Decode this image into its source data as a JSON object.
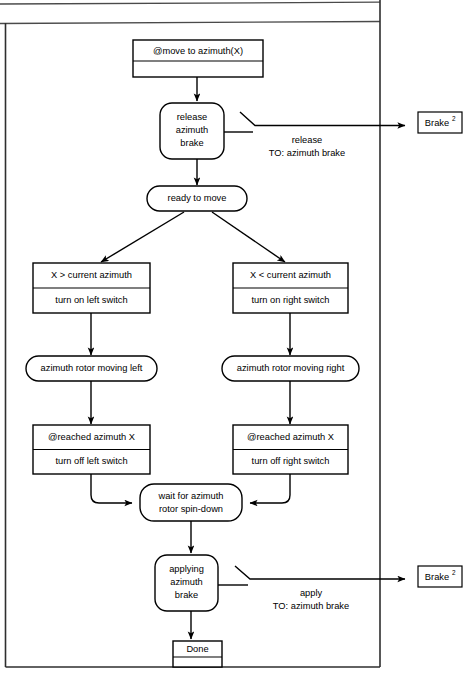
{
  "diagram": {
    "type": "state-flow-chart",
    "nodes": {
      "start": {
        "shape": "rectangle-two-row",
        "label": "@move to azimuth(X)",
        "second_row": ""
      },
      "release_brake": {
        "shape": "rounded",
        "line1": "release",
        "line2": "azimuth",
        "line3": "brake"
      },
      "ready": {
        "shape": "rounded",
        "label": "ready to move"
      },
      "cond_left": {
        "shape": "rectangle-two-row",
        "row1": "X > current azimuth",
        "row2": "turn on left switch"
      },
      "cond_right": {
        "shape": "rectangle-two-row",
        "row1": "X < current azimuth",
        "row2": "turn on right switch"
      },
      "moving_left": {
        "shape": "rounded",
        "label": "azimuth rotor moving left"
      },
      "moving_right": {
        "shape": "rounded",
        "label": "azimuth rotor moving right"
      },
      "reached_left": {
        "shape": "rectangle-two-row",
        "row1": "@reached azimuth X",
        "row2": "turn off left switch"
      },
      "reached_right": {
        "shape": "rectangle-two-row",
        "row1": "@reached azimuth X",
        "row2": "turn off right switch"
      },
      "wait_spindown": {
        "shape": "rounded",
        "line1": "wait for azimuth",
        "line2": "rotor spin-down"
      },
      "applying_brake": {
        "shape": "rounded",
        "line1": "applying",
        "line2": "azimuth",
        "line3": "brake"
      },
      "done": {
        "shape": "rectangle-two-row",
        "label": "Done",
        "second_row": ""
      }
    },
    "external_refs": [
      {
        "label": "Brake",
        "superscript": "2"
      },
      {
        "label": "Brake",
        "superscript": "2"
      }
    ],
    "edge_labels": {
      "release_msg_line1": "release",
      "release_msg_line2": "TO: azimuth brake",
      "apply_msg_line1": "apply",
      "apply_msg_line2": "TO: azimuth brake"
    },
    "colors": {
      "stroke": "#000000",
      "fill": "#ffffff",
      "frame": "#2e2e2e"
    }
  }
}
